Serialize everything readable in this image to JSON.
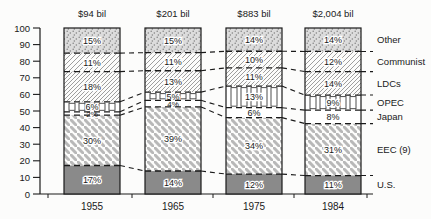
{
  "chart_data": {
    "type": "bar",
    "subtype": "stacked-100-percent",
    "title": "",
    "xlabel": "",
    "ylabel": "",
    "ylim": [
      0,
      100
    ],
    "yticks": [
      0,
      10,
      20,
      30,
      40,
      50,
      60,
      70,
      80,
      90,
      100
    ],
    "grid": false,
    "legend_position": "right-labels",
    "value_suffix": "%",
    "categories": [
      "1955",
      "1965",
      "1975",
      "1984"
    ],
    "column_headers": [
      "$94 bil",
      "$201 bil",
      "$883 bil",
      "$2,004 bil"
    ],
    "series": [
      {
        "name": "U.S.",
        "pattern": "solid-gray",
        "values": [
          17,
          14,
          12,
          11
        ]
      },
      {
        "name": "EEC (9)",
        "pattern": "thick-diagonal-stripes",
        "values": [
          30,
          39,
          34,
          31
        ]
      },
      {
        "name": "Japan",
        "pattern": "plain-white",
        "values": [
          2,
          4,
          6,
          8
        ]
      },
      {
        "name": "OPEC",
        "pattern": "vertical-blocks",
        "values": [
          6,
          5,
          13,
          9
        ]
      },
      {
        "name": "LDCs",
        "pattern": "thin-diagonal-hatch-dense",
        "values": [
          18,
          13,
          11,
          14
        ]
      },
      {
        "name": "Communist",
        "pattern": "thin-diagonal-hatch",
        "values": [
          11,
          11,
          10,
          12
        ]
      },
      {
        "name": "Other",
        "pattern": "stipple",
        "values": [
          15,
          15,
          14,
          14
        ]
      }
    ],
    "colors": {
      "ink": "#1a1a1a",
      "background": "#fcfcfb",
      "us_solid_fill": "#8a8a8a",
      "stipple_background": "#dcdcdc",
      "stipple_dot": "#808080",
      "thin_hatch_line": "#9e9e9e",
      "thick_stripe_line": "#b8b8b8",
      "opec_block_outline": "#4f4f4f"
    }
  }
}
